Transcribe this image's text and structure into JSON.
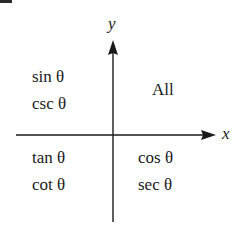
{
  "diagram": {
    "axes": {
      "x_label": "x",
      "y_label": "y"
    },
    "quadrants": {
      "Q1": {
        "lines": [
          "All"
        ]
      },
      "Q2": {
        "lines": [
          "sin θ",
          "csc θ"
        ]
      },
      "Q3": {
        "lines": [
          "tan θ",
          "cot θ"
        ]
      },
      "Q4": {
        "lines": [
          "cos θ",
          "sec θ"
        ]
      }
    },
    "colors": {
      "ink": "#1a1a1a",
      "background": "#ffffff"
    }
  }
}
